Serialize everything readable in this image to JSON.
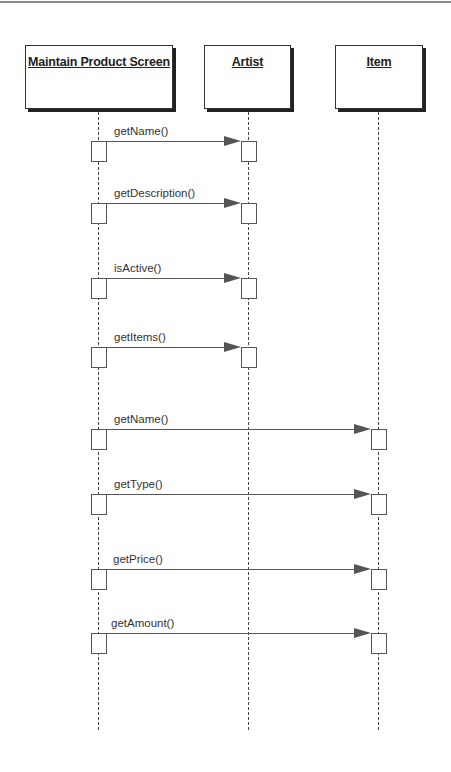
{
  "diagram": {
    "type": "UML sequence diagram",
    "objects": [
      {
        "name": "Maintain Product Screen",
        "x": 25,
        "width": 148,
        "lifeline_x": 99
      },
      {
        "name": "Artist",
        "x": 204,
        "width": 87,
        "lifeline_x": 248
      },
      {
        "name": "Item",
        "x": 335,
        "width": 88,
        "lifeline_x": 378
      }
    ],
    "messages": [
      {
        "label": "getName()",
        "from": "Maintain Product Screen",
        "to": "Artist",
        "y": 141
      },
      {
        "label": "getDescription()",
        "from": "Maintain Product Screen",
        "to": "Artist",
        "y": 203
      },
      {
        "label": "isActive()",
        "from": "Maintain Product Screen",
        "to": "Artist",
        "y": 278
      },
      {
        "label": "getItems()",
        "from": "Maintain Product Screen",
        "to": "Artist",
        "y": 347
      },
      {
        "label": "getName()",
        "from": "Maintain Product Screen",
        "to": "Item",
        "y": 429
      },
      {
        "label": "getType()",
        "from": "Maintain Product Screen",
        "to": "Item",
        "y": 494
      },
      {
        "label": "getPrice()",
        "from": "Maintain Product Screen",
        "to": "Item",
        "y": 569
      },
      {
        "label": "getAmount()",
        "from": "Maintain Product Screen",
        "to": "Item",
        "y": 633
      }
    ],
    "colors": {
      "line": "#555555",
      "shadow": "#222222",
      "text": "#333333",
      "background": "#ffffff"
    }
  }
}
